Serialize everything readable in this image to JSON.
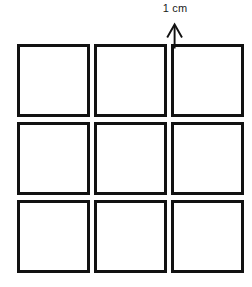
{
  "figure": {
    "background_color": "#ffffff",
    "line_color": "#111111",
    "text_color": "#1a1a1a"
  },
  "annotation": {
    "label": "1 cm",
    "icon": "up-caret-arrow-icon",
    "points_to": "gap-between-column-2-and-column-3",
    "target_row": 1
  },
  "grid": {
    "rows": 3,
    "columns": 3,
    "cell_count": 9,
    "cell_size_px": 73,
    "cell_border_px": 3,
    "column_gap_px": 4,
    "row_gap_px": 5,
    "cells": [
      {
        "id": "r1c1",
        "row": 1,
        "column": 1,
        "label": ""
      },
      {
        "id": "r1c2",
        "row": 1,
        "column": 2,
        "label": ""
      },
      {
        "id": "r1c3",
        "row": 1,
        "column": 3,
        "label": ""
      },
      {
        "id": "r2c1",
        "row": 2,
        "column": 1,
        "label": ""
      },
      {
        "id": "r2c2",
        "row": 2,
        "column": 2,
        "label": ""
      },
      {
        "id": "r2c3",
        "row": 2,
        "column": 3,
        "label": ""
      },
      {
        "id": "r3c1",
        "row": 3,
        "column": 1,
        "label": ""
      },
      {
        "id": "r3c2",
        "row": 3,
        "column": 2,
        "label": ""
      },
      {
        "id": "r3c3",
        "row": 3,
        "column": 3,
        "label": ""
      }
    ]
  }
}
